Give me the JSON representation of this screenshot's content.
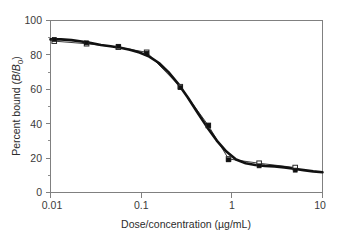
{
  "chart_data": {
    "type": "line",
    "title": "",
    "subtitle": "",
    "xlabel": "Dose/concentration (µg/mL)",
    "ylabel": "Percent bound (B/B₀)",
    "ylabel_parts": {
      "prefix": "Percent bound (",
      "italic_b": "B",
      "slash": "/",
      "italic_b2": "B",
      "subscript": "0",
      "suffix": ")"
    },
    "xlabel_parts": {
      "main": "Dose/concentration (µg/mL)"
    },
    "xscale": "log",
    "yscale": "linear",
    "xlim": [
      0.01,
      10
    ],
    "ylim": [
      0,
      100
    ],
    "grid": false,
    "legend": "none",
    "x_ticks": [
      "0.01",
      "0.1",
      "1",
      "10"
    ],
    "x_tick_values": [
      0.01,
      0.1,
      1,
      10
    ],
    "y_ticks": [
      "0",
      "20",
      "40",
      "60",
      "80",
      "100"
    ],
    "y_tick_values": [
      0,
      20,
      40,
      60,
      80,
      100
    ],
    "y_minor_tick_values": [
      10,
      30,
      50,
      70,
      90
    ],
    "series": [
      {
        "name": "Observed (filled squares)",
        "marker": "filled-square",
        "color": "#111111",
        "x": [
          0.011,
          0.025,
          0.056,
          0.115,
          0.27,
          0.55,
          0.92,
          2.0,
          5.0
        ],
        "values": [
          89,
          87,
          85,
          81,
          61,
          39,
          19,
          15.5,
          13
        ]
      },
      {
        "name": "Predicted (open squares)",
        "marker": "open-square",
        "color": "#ffffff",
        "x": [
          0.011,
          0.025,
          0.056,
          0.115,
          0.27,
          0.55,
          0.92,
          2.0,
          5.0
        ],
        "values": [
          88,
          86.5,
          84.5,
          81.5,
          61.5,
          39,
          19.5,
          17,
          14.5
        ]
      }
    ],
    "fit_curve": {
      "name": "Four-parameter logistic fit",
      "x": [
        0.01,
        0.013,
        0.017,
        0.022,
        0.028,
        0.036,
        0.046,
        0.059,
        0.075,
        0.096,
        0.123,
        0.157,
        0.2,
        0.256,
        0.327,
        0.418,
        0.534,
        0.682,
        0.871,
        1.113,
        1.422,
        1.817,
        2.321,
        2.966,
        3.789,
        4.841,
        6.185,
        7.903,
        10.0
      ],
      "values": [
        89.0,
        89.0,
        88.6,
        87.8,
        86.9,
        85.8,
        85.0,
        84.2,
        83.0,
        81.4,
        79.0,
        75.3,
        70.0,
        63.2,
        55.2,
        46.5,
        38.0,
        30.2,
        23.8,
        19.2,
        17.0,
        16.0,
        15.5,
        15.2,
        14.6,
        13.8,
        13.0,
        12.3,
        11.8
      ]
    }
  }
}
